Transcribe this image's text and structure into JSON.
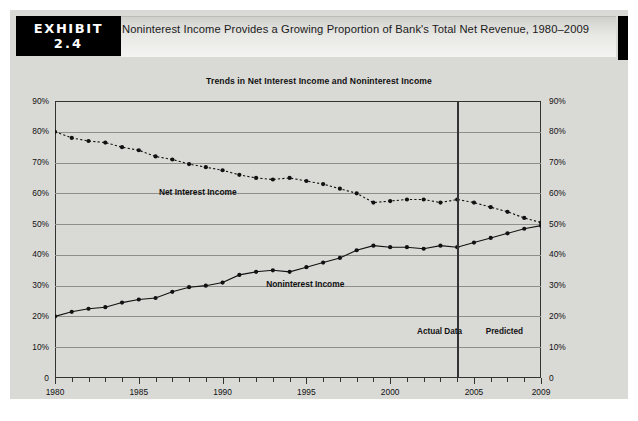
{
  "header": {
    "exhibit_word": "EXHIBIT",
    "exhibit_number": "2.4",
    "title": "Noninterest Income Provides a Growing Proportion of Bank's Total Net Revenue, 1980–2009"
  },
  "chart_data": {
    "type": "line",
    "title": "Trends in Net Interest Income and Noninterest Income",
    "xlabel": "",
    "ylabel": "",
    "xlim": [
      1980,
      2009
    ],
    "ylim": [
      0,
      90
    ],
    "grid": true,
    "legend_position": "inline-annotations",
    "y_tick_labels": [
      "90%",
      "80%",
      "70%",
      "60%",
      "50%",
      "40%",
      "30%",
      "20%",
      "10%",
      "0"
    ],
    "y_tick_values": [
      90,
      80,
      70,
      60,
      50,
      40,
      30,
      20,
      10,
      0
    ],
    "x_tick_labels": [
      "1980",
      "1985",
      "1990",
      "1995",
      "2000",
      "2005",
      "2009"
    ],
    "x_tick_values": [
      1980,
      1985,
      1990,
      1995,
      2000,
      2005,
      2009
    ],
    "x": [
      1980,
      1981,
      1982,
      1983,
      1984,
      1985,
      1986,
      1987,
      1988,
      1989,
      1990,
      1991,
      1992,
      1993,
      1994,
      1995,
      1996,
      1997,
      1998,
      1999,
      2000,
      2001,
      2002,
      2003,
      2004,
      2005,
      2006,
      2007,
      2008,
      2009
    ],
    "series": [
      {
        "name": "Net Interest Income",
        "style": "dotted",
        "values": [
          80,
          78,
          77,
          76.5,
          75,
          74,
          72,
          71,
          69.5,
          68.5,
          67.5,
          66,
          65,
          64.5,
          65,
          64,
          63,
          61.5,
          60,
          57,
          57.5,
          58,
          58,
          57,
          58,
          57,
          55.5,
          54,
          52,
          50.5
        ]
      },
      {
        "name": "Noninterest Income",
        "style": "solid",
        "values": [
          20,
          21.5,
          22.5,
          23,
          24.5,
          25.5,
          26,
          28,
          29.5,
          30,
          31,
          33.5,
          34.5,
          35,
          34.5,
          36,
          37.5,
          39,
          41.5,
          43,
          42.5,
          42.5,
          42,
          43,
          42.5,
          44,
          45.5,
          47,
          48.5,
          49.5
        ]
      }
    ],
    "annotations": [
      {
        "id": "actual-data",
        "text": "Actual Data",
        "x": 2001.6,
        "y": 15
      },
      {
        "id": "predicted",
        "text": "Predicted",
        "x": 2005.7,
        "y": 15
      },
      {
        "id": "net-interest-income-label",
        "text": "Net Interest Income",
        "x": 1986.2,
        "y": 60.5
      },
      {
        "id": "noninterest-income-label",
        "text": "Noninterest Income",
        "x": 1992.6,
        "y": 30.5
      }
    ],
    "divider": {
      "x": 2004,
      "label_left": "Actual Data",
      "label_right": "Predicted"
    }
  },
  "colors": {
    "background": "#d9d9d6",
    "badge": "#000000",
    "ink": "#111111",
    "grid": "#8e8e8a",
    "axis": "#333333"
  }
}
